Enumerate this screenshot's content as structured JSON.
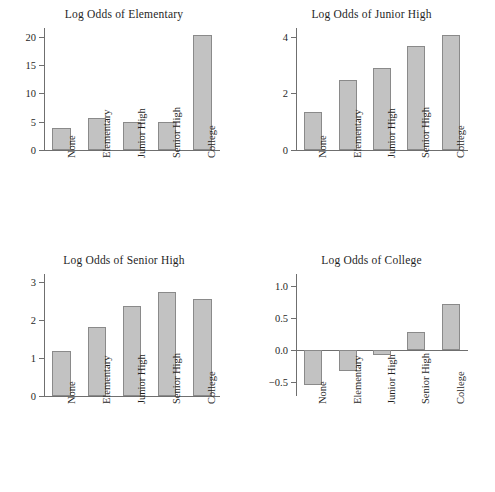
{
  "figure": {
    "panel_count": 4,
    "bar_fill_color": "#c2c2c2",
    "bar_border_color": "#8a8a8a",
    "axis_color": "#6f6f6f",
    "background_color": "#ffffff"
  },
  "chart_data": [
    {
      "type": "bar",
      "title": "Log Odds of Elementary",
      "categories": [
        "None",
        "Elementary",
        "Junior High",
        "Senior High",
        "College"
      ],
      "values": [
        3.9,
        5.7,
        5.0,
        4.85,
        20.3
      ],
      "xlabel": "",
      "ylabel": "",
      "ylim": [
        0,
        21.5
      ],
      "yticks": [
        0,
        5,
        10,
        15,
        20
      ],
      "ytick_labels": [
        "0",
        "5",
        "10",
        "15",
        "20"
      ],
      "grid": false,
      "legend": "none"
    },
    {
      "type": "bar",
      "title": "Log Odds of Junior High",
      "categories": [
        "None",
        "Elementary",
        "Junior High",
        "Senior High",
        "College"
      ],
      "values": [
        1.35,
        2.45,
        2.9,
        3.65,
        4.05
      ],
      "xlabel": "",
      "ylabel": "",
      "ylim": [
        0,
        4.3
      ],
      "yticks": [
        0,
        2,
        4
      ],
      "ytick_labels": [
        "0",
        "2",
        "4"
      ],
      "grid": false,
      "legend": "none"
    },
    {
      "type": "bar",
      "title": "Log Odds of Senior High",
      "categories": [
        "None",
        "Elementary",
        "Junior High",
        "Senior High",
        "College"
      ],
      "values": [
        1.18,
        1.82,
        2.35,
        2.72,
        2.54
      ],
      "xlabel": "",
      "ylabel": "",
      "ylim": [
        0,
        3.2
      ],
      "yticks": [
        0,
        1,
        2,
        3
      ],
      "ytick_labels": [
        "0",
        "1",
        "2",
        "3"
      ],
      "grid": false,
      "legend": "none"
    },
    {
      "type": "bar",
      "title": "Log Odds of College",
      "categories": [
        "None",
        "Elementary",
        "Junior High",
        "Senior High",
        "College"
      ],
      "values": [
        -0.55,
        -0.33,
        -0.08,
        0.28,
        0.72
      ],
      "xlabel": "",
      "ylabel": "",
      "ylim": [
        -0.72,
        1.18
      ],
      "yticks": [
        -0.5,
        0.0,
        0.5,
        1.0
      ],
      "ytick_labels": [
        "-0.5",
        "0.0",
        "0.5",
        "1.0"
      ],
      "grid": false,
      "legend": "none"
    }
  ]
}
